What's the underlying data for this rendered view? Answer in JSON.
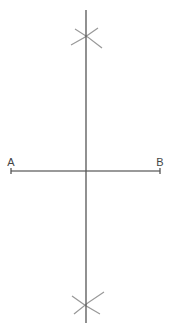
{
  "diagram": {
    "type": "perpendicular-bisector-construction",
    "colors": {
      "background": "#ffffff",
      "bisector": "#555555",
      "segment": "#777777",
      "arcs": "#999999",
      "labels": "#444444"
    },
    "segment": {
      "start": {
        "label": "A",
        "x": 11,
        "y": 171
      },
      "end": {
        "label": "B",
        "x": 160,
        "y": 171
      }
    },
    "bisector": {
      "x": 86,
      "y_top": 10,
      "y_bottom": 323
    },
    "arcs_top": {
      "intersection": {
        "x": 86,
        "y": 35
      },
      "arc1": {
        "x1": 71,
        "y1": 45,
        "x2": 98,
        "y2": 28
      },
      "arc2": {
        "x1": 75,
        "y1": 29,
        "x2": 102,
        "y2": 48
      }
    },
    "arcs_bottom": {
      "intersection": {
        "x": 86,
        "y": 306
      },
      "arc1": {
        "x1": 72,
        "y1": 296,
        "x2": 100,
        "y2": 314
      },
      "arc2": {
        "x1": 74,
        "y1": 314,
        "x2": 104,
        "y2": 292
      }
    }
  }
}
